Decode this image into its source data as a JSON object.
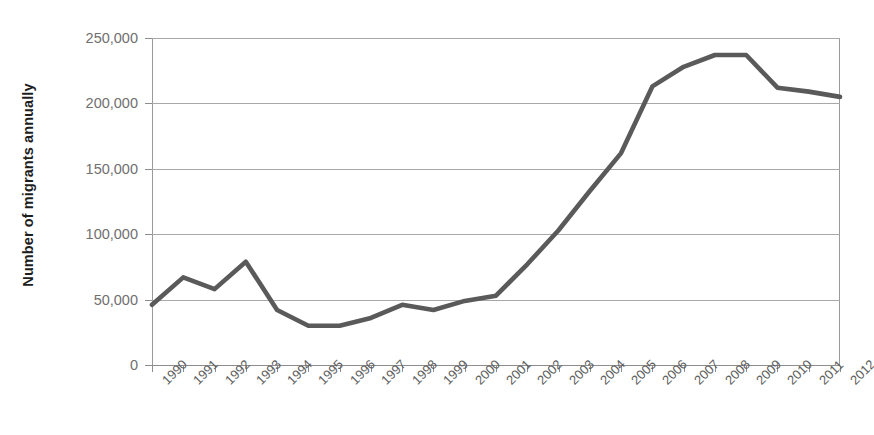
{
  "chart_data": {
    "type": "line",
    "title": "",
    "xlabel": "",
    "ylabel": "Number of migrants annually",
    "categories": [
      "1990",
      "1991",
      "1992",
      "1993",
      "1994",
      "1995",
      "1996",
      "1997",
      "1998",
      "1999",
      "2000",
      "2001",
      "2002",
      "2003",
      "2004",
      "2005",
      "2006",
      "2007",
      "2008",
      "2009",
      "2010",
      "2011",
      "2012"
    ],
    "values": [
      46000,
      67000,
      58000,
      79000,
      42000,
      30000,
      30000,
      36000,
      46000,
      42000,
      49000,
      53000,
      77000,
      103000,
      133000,
      162000,
      213000,
      228000,
      237000,
      237000,
      212000,
      209000,
      205000
    ],
    "series": [
      {
        "name": "Number of migrants annually",
        "values": [
          46000,
          67000,
          58000,
          79000,
          42000,
          30000,
          30000,
          36000,
          46000,
          42000,
          49000,
          53000,
          77000,
          103000,
          133000,
          162000,
          213000,
          228000,
          237000,
          237000,
          212000,
          209000,
          205000
        ]
      }
    ],
    "ylim": [
      0,
      250000
    ],
    "y_ticks": [
      0,
      50000,
      100000,
      150000,
      200000,
      250000
    ],
    "y_tick_labels": [
      "0",
      "50,000",
      "100,000",
      "150,000",
      "200,000",
      "250,000"
    ],
    "grid": true,
    "legend": false,
    "legend_position": "none",
    "line_color": "#5a5a5a",
    "gridline_color": "#a8a8a8",
    "axis_color": "#8d8d8d",
    "tick_label_color": "#6f6f6f",
    "axis_title_color": "#1d1d1d",
    "background_color": "#ffffff"
  },
  "axes": {
    "y_title": "Number of migrants annually"
  }
}
